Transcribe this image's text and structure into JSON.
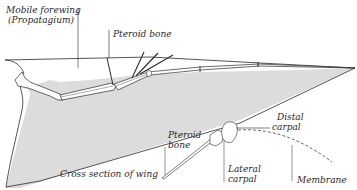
{
  "diagram": {
    "labels": {
      "mobile_forewing_line1": "Mobile forewing",
      "mobile_forewing_line2": "(Propatagium)",
      "pteroid_bone": "Pteroid bone",
      "cross_section": "Cross section of wing",
      "pteroid_bone_detail_line1": "Pteroid",
      "pteroid_bone_detail_line2": "bone",
      "distal_carpal_line1": "Distal",
      "distal_carpal_line2": "carpal",
      "lateral_carpal_line1": "Lateral",
      "lateral_carpal_line2": "carpal",
      "membrane": "Membrane"
    },
    "colors": {
      "membrane_fill": "#dcdcdc",
      "line": "#2a2a2a",
      "background": "#ffffff"
    }
  }
}
